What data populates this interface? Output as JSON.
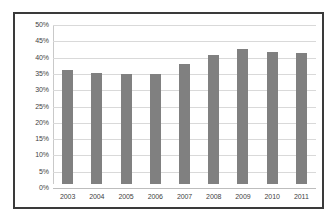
{
  "chart_data": {
    "type": "bar",
    "title": "",
    "subtitle": "",
    "xlabel": "",
    "ylabel": "",
    "categories": [
      "2003",
      "2004",
      "2005",
      "2006",
      "2007",
      "2008",
      "2009",
      "2010",
      "2011"
    ],
    "values": [
      35.8,
      34.8,
      34.7,
      34.7,
      37.7,
      40.5,
      42.6,
      41.4,
      41.2
    ],
    "value_format": "percent",
    "ylim": [
      0,
      50
    ],
    "yticks": [
      "0%",
      "5%",
      "10%",
      "15%",
      "20%",
      "25%",
      "30%",
      "35%",
      "40%",
      "45%",
      "50%"
    ],
    "ytick_values": [
      0,
      5,
      10,
      15,
      20,
      25,
      30,
      35,
      40,
      45,
      50
    ],
    "grid": true,
    "grid_axis": "y",
    "legend": false,
    "legend_position": "none",
    "series": [
      {
        "name": "",
        "color": "#808080",
        "values": [
          35.8,
          34.8,
          34.7,
          34.7,
          37.7,
          40.5,
          42.6,
          41.4,
          41.2
        ]
      }
    ],
    "annotations": []
  },
  "style": {
    "bar_color": "#808080",
    "grid_color": "#d9d9d9",
    "axis_color": "#bdbdbd",
    "border_color": "#3a3a3a",
    "text_color": "#3f3f3f",
    "background": "#ffffff"
  }
}
